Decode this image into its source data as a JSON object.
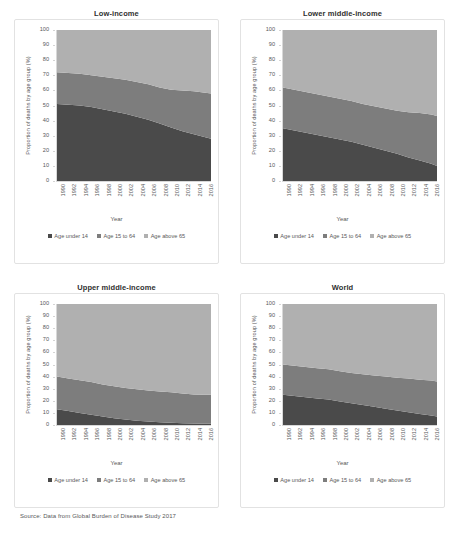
{
  "figure": {
    "source_note": "Source: Data from Global Burden of Disease Study 2017",
    "colors": {
      "age_under_14": "#4a4a4a",
      "age_15_to_64": "#7d7d7d",
      "age_above_65": "#b0b0b0",
      "panel_border": "#e2e2e2",
      "axis": "#d8d8d8",
      "text": "#58585a"
    }
  },
  "axes": {
    "ylabel": "Proportion of deaths by age group (%)",
    "xlabel": "Year",
    "yticks": [
      "0",
      "10",
      "20",
      "30",
      "40",
      "50",
      "60",
      "70",
      "80",
      "90",
      "100"
    ],
    "ylim": [
      0,
      100
    ],
    "xticks": [
      "1990",
      "1992",
      "1994",
      "1996",
      "1998",
      "2000",
      "2002",
      "2004",
      "2006",
      "2008",
      "2010",
      "2012",
      "2014",
      "2016"
    ],
    "xlim": [
      1990,
      2017
    ]
  },
  "legend": {
    "position": "bottom",
    "entries": [
      {
        "label": "Age under 14",
        "color": "#4a4a4a"
      },
      {
        "label": "Age 15 to 64",
        "color": "#7d7d7d"
      },
      {
        "label": "Age above 65",
        "color": "#b0b0b0"
      }
    ]
  },
  "chart_data": [
    {
      "type": "area",
      "stacked": true,
      "title": "Low-income",
      "xlabel": "Year",
      "ylabel": "Proportion of deaths by age group (%)",
      "ylim": [
        0,
        100
      ],
      "grid": false,
      "legend_position": "bottom",
      "x": [
        1990,
        1992,
        1994,
        1996,
        1998,
        2000,
        2002,
        2004,
        2006,
        2008,
        2010,
        2012,
        2014,
        2016,
        2017
      ],
      "series": [
        {
          "name": "Age under 14",
          "color": "#4a4a4a",
          "values": [
            51,
            50.5,
            50,
            49,
            47.5,
            46,
            44.5,
            42.5,
            40.5,
            38,
            35.5,
            33,
            31,
            29,
            28
          ]
        },
        {
          "name": "Age 15 to 64",
          "color": "#7d7d7d",
          "values": [
            21,
            21,
            21,
            21,
            21.5,
            22,
            22.5,
            23,
            23.5,
            24,
            25,
            27,
            28.5,
            29.5,
            30
          ]
        },
        {
          "name": "Age above 65",
          "color": "#b0b0b0",
          "values": [
            28,
            28.5,
            29,
            30,
            31,
            32,
            33,
            34.5,
            36,
            38,
            39.5,
            40,
            40.5,
            41.5,
            42
          ]
        }
      ],
      "cumulative_boundaries": {
        "under_14_top": [
          51,
          28
        ],
        "age_15_64_top": [
          72,
          58
        ]
      }
    },
    {
      "type": "area",
      "stacked": true,
      "title": "Lower middle-income",
      "xlabel": "Year",
      "ylabel": "Proportion of deaths by age group (%)",
      "ylim": [
        0,
        100
      ],
      "grid": false,
      "legend_position": "bottom",
      "x": [
        1990,
        1992,
        1994,
        1996,
        1998,
        2000,
        2002,
        2004,
        2006,
        2008,
        2010,
        2012,
        2014,
        2016,
        2017
      ],
      "series": [
        {
          "name": "Age under 14",
          "color": "#4a4a4a",
          "values": [
            35,
            33.5,
            32,
            30.5,
            29,
            27.5,
            26,
            24,
            22,
            20,
            18,
            15.5,
            13.5,
            11.5,
            10
          ]
        },
        {
          "name": "Age 15 to 64",
          "color": "#7d7d7d",
          "values": [
            27,
            27,
            27,
            27,
            27,
            27,
            27,
            27,
            27.5,
            28,
            28.5,
            30,
            31.5,
            32.5,
            33
          ]
        },
        {
          "name": "Age above 65",
          "color": "#b0b0b0",
          "values": [
            38,
            39.5,
            41,
            42.5,
            44,
            45.5,
            47,
            49,
            50.5,
            52,
            53.5,
            54.5,
            55,
            56,
            57
          ]
        }
      ],
      "cumulative_boundaries": {
        "under_14_top": [
          35,
          10
        ],
        "age_15_64_top": [
          62,
          43
        ]
      }
    },
    {
      "type": "area",
      "stacked": true,
      "title": "Upper middle-income",
      "xlabel": "Year",
      "ylabel": "Proportion of deaths by age group (%)",
      "ylim": [
        0,
        100
      ],
      "grid": false,
      "legend_position": "bottom",
      "x": [
        1990,
        1992,
        1994,
        1996,
        1998,
        2000,
        2002,
        2004,
        2006,
        2008,
        2010,
        2012,
        2014,
        2016,
        2017
      ],
      "series": [
        {
          "name": "Age under 14",
          "color": "#4a4a4a",
          "values": [
            13,
            11.5,
            10,
            8.5,
            7,
            5.5,
            4.5,
            3.5,
            2.8,
            2.2,
            1.8,
            1.5,
            1.3,
            1.1,
            1
          ]
        },
        {
          "name": "Age 15 to 64",
          "color": "#7d7d7d",
          "values": [
            27,
            27,
            27,
            27,
            26.5,
            26.5,
            26,
            26,
            25.8,
            25.5,
            25.2,
            24.5,
            24,
            24,
            24
          ]
        },
        {
          "name": "Age above 65",
          "color": "#b0b0b0",
          "values": [
            60,
            61.5,
            63,
            64.5,
            66.5,
            68,
            69.5,
            70.5,
            71.4,
            72.3,
            73,
            74,
            74.7,
            74.9,
            75
          ]
        }
      ],
      "cumulative_boundaries": {
        "under_14_top": [
          13,
          1
        ],
        "age_15_64_top": [
          40,
          25
        ]
      }
    },
    {
      "type": "area",
      "stacked": true,
      "title": "World",
      "xlabel": "Year",
      "ylabel": "Proportion of deaths by age group (%)",
      "ylim": [
        0,
        100
      ],
      "grid": false,
      "legend_position": "bottom",
      "x": [
        1990,
        1992,
        1994,
        1996,
        1998,
        2000,
        2002,
        2004,
        2006,
        2008,
        2010,
        2012,
        2014,
        2016,
        2017
      ],
      "series": [
        {
          "name": "Age under 14",
          "color": "#4a4a4a",
          "values": [
            25,
            24,
            23,
            22,
            21,
            19.5,
            18,
            16.5,
            15,
            13.5,
            12,
            10.5,
            9,
            7.8,
            7
          ]
        },
        {
          "name": "Age 15 to 64",
          "color": "#7d7d7d",
          "values": [
            25,
            25,
            25,
            25,
            25,
            25,
            25,
            25.5,
            26,
            26.5,
            27,
            28,
            28.5,
            29,
            29
          ]
        },
        {
          "name": "Age above 65",
          "color": "#b0b0b0",
          "values": [
            50,
            51,
            52,
            53,
            54,
            55.5,
            57,
            58,
            59,
            60,
            61,
            61.5,
            62.5,
            63.2,
            64
          ]
        }
      ],
      "cumulative_boundaries": {
        "under_14_top": [
          25,
          7
        ],
        "age_15_64_top": [
          50,
          36
        ]
      }
    }
  ]
}
